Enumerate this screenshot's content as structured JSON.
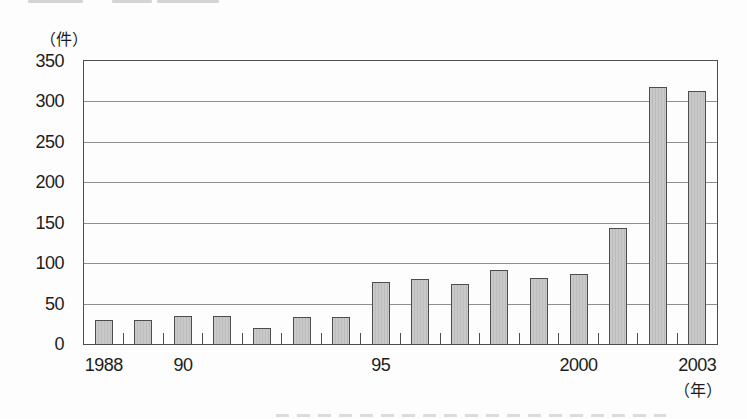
{
  "chart_data": {
    "type": "bar",
    "title": "",
    "ylabel": "（件）",
    "xlabel": "（年）",
    "categories": [
      "1988",
      "1989",
      "1990",
      "1991",
      "1992",
      "1993",
      "1994",
      "1995",
      "1996",
      "1997",
      "1998",
      "1999",
      "2000",
      "2001",
      "2002",
      "2003"
    ],
    "values": [
      30,
      30,
      35,
      35,
      20,
      33,
      33,
      77,
      80,
      74,
      91,
      82,
      86,
      143,
      318,
      313
    ],
    "ylim": [
      0,
      350
    ],
    "y_ticks": [
      0,
      50,
      100,
      150,
      200,
      250,
      300,
      350
    ],
    "x_tick_labels": [
      {
        "label": "1988",
        "slot": 0
      },
      {
        "label": "90",
        "slot": 2
      },
      {
        "label": "95",
        "slot": 7
      },
      {
        "label": "2000",
        "slot": 12
      },
      {
        "label": "2003",
        "slot": 15
      }
    ],
    "grid": "horizontal",
    "legend": "none",
    "colors": {
      "bar_fill": "#c9c9c9",
      "bar_stripe": "#bcbcbc",
      "bar_border": "#4d4d4d",
      "gridline": "#8f8f8f",
      "axis_box": "#4d4d4d",
      "text": "#1c1c1c",
      "background": "#fdfdfd"
    }
  },
  "artifacts": {
    "top_strips": [
      {
        "x": 28,
        "w": 55
      },
      {
        "x": 112,
        "w": 40
      },
      {
        "x": 157,
        "w": 62
      }
    ],
    "bottom_strip": {
      "x": 276,
      "w": 390
    }
  }
}
